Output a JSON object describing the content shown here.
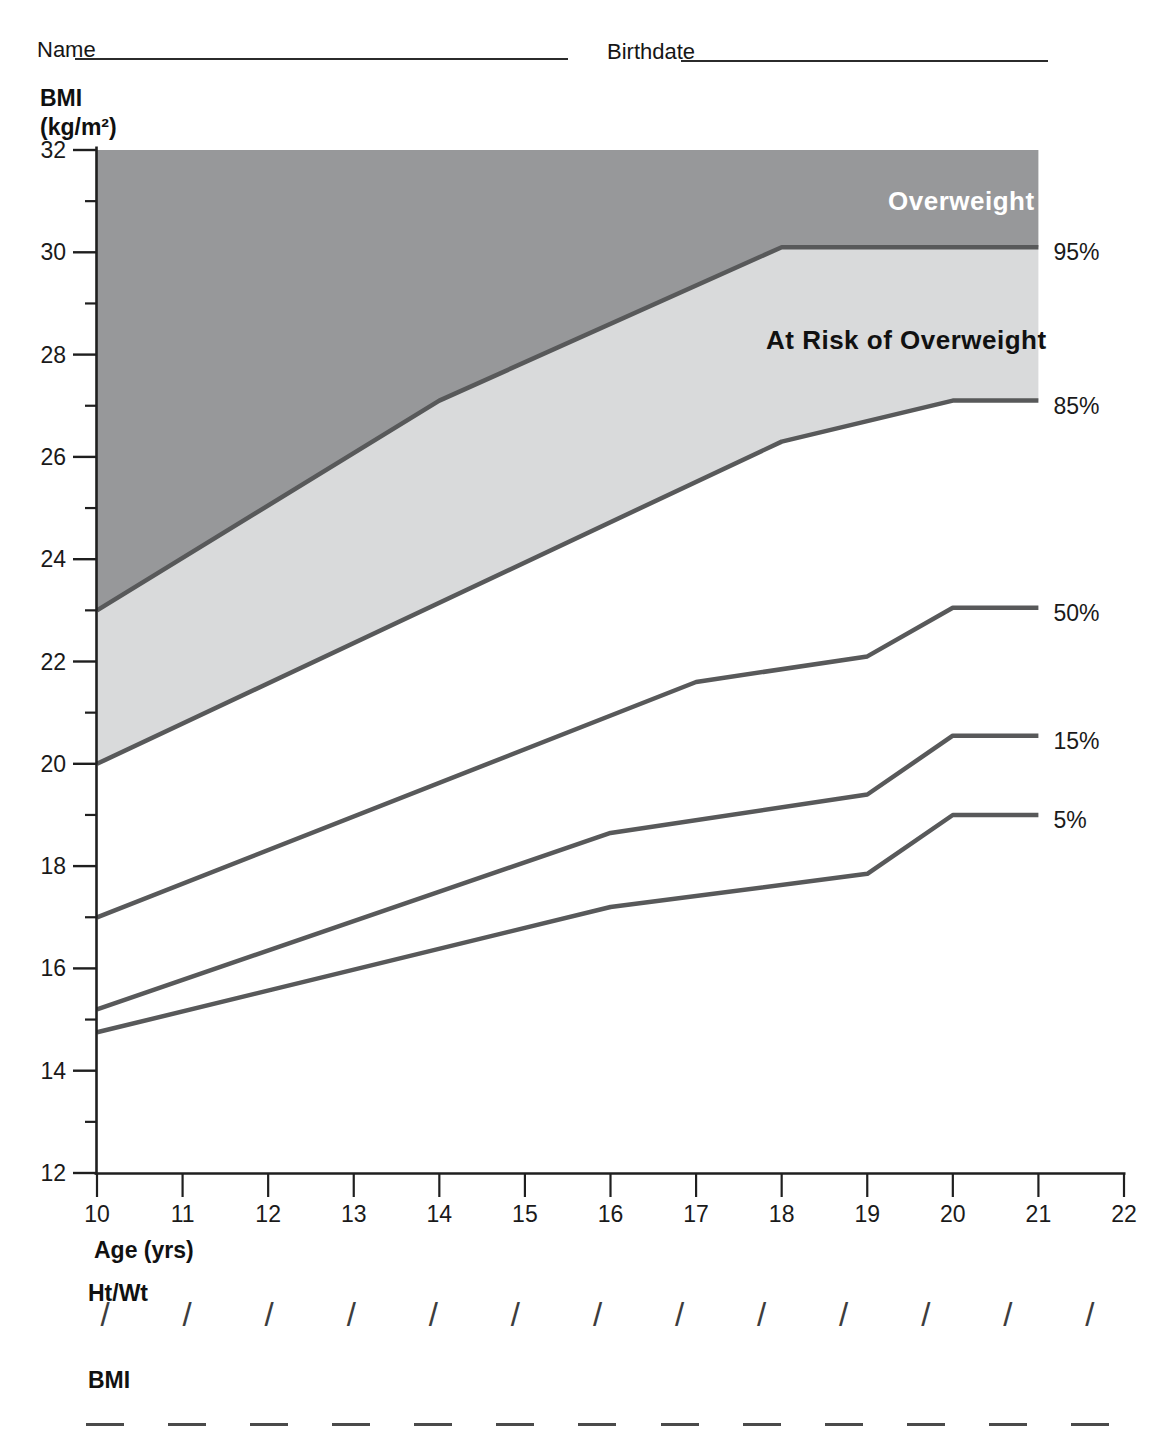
{
  "header": {
    "name_label": "Name",
    "birthdate_label": "Birthdate"
  },
  "y_axis_title": {
    "line1": "BMI",
    "line2": "(kg/m²)"
  },
  "x_axis_label": "Age (yrs)",
  "chart_data": {
    "type": "line",
    "xlabel": "Age (yrs)",
    "ylabel": "BMI (kg/m²)",
    "xlim": [
      10,
      22
    ],
    "ylim": [
      12,
      32
    ],
    "grid": false,
    "x_ticks": [
      10,
      11,
      12,
      13,
      14,
      15,
      16,
      17,
      18,
      19,
      20,
      21,
      22
    ],
    "y_major_ticks": [
      32,
      30,
      28,
      26,
      24,
      22,
      20,
      18,
      16,
      14,
      12
    ],
    "y_minor_ticks": [
      31,
      29,
      27,
      25,
      23,
      21,
      19,
      17,
      15,
      13
    ],
    "series": [
      {
        "name": "95%",
        "points": [
          [
            10,
            23.0
          ],
          [
            14,
            27.1
          ],
          [
            18,
            30.1
          ],
          [
            21,
            30.1
          ]
        ]
      },
      {
        "name": "85%",
        "points": [
          [
            10,
            20.0
          ],
          [
            18,
            26.3
          ],
          [
            20,
            27.1
          ],
          [
            21,
            27.1
          ]
        ]
      },
      {
        "name": "50%",
        "points": [
          [
            10,
            17.0
          ],
          [
            17,
            21.6
          ],
          [
            19,
            22.1
          ],
          [
            20,
            23.05
          ],
          [
            21,
            23.05
          ]
        ]
      },
      {
        "name": "15%",
        "points": [
          [
            10,
            15.2
          ],
          [
            16,
            18.65
          ],
          [
            19,
            19.4
          ],
          [
            20,
            20.55
          ],
          [
            21,
            20.55
          ]
        ]
      },
      {
        "name": "5%",
        "points": [
          [
            10,
            14.75
          ],
          [
            16,
            17.2
          ],
          [
            19,
            17.85
          ],
          [
            20,
            19.0
          ],
          [
            21,
            19.0
          ]
        ]
      }
    ],
    "regions": [
      {
        "label": "Overweight",
        "between": [
          "top",
          "95%"
        ],
        "fill": "#97989a",
        "text_color": "#ffffff"
      },
      {
        "label": "At Risk of Overweight",
        "between": [
          "95%",
          "85%"
        ],
        "fill": "#d9dadb",
        "text_color": "#111111"
      }
    ],
    "line_color": "#58595a",
    "axis_color": "#1f1f1f",
    "tick_label_color": "#1a1a1a",
    "legend_position": "right-of-curve-ends"
  },
  "footer": {
    "htwt_label": "Ht/Wt",
    "bmi_label": "BMI",
    "columns": 13,
    "slash_glyph": "/"
  }
}
